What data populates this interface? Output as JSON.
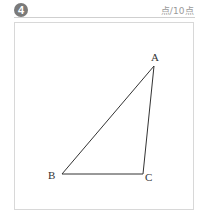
{
  "question": {
    "number": "4",
    "score_label": "点/10点"
  },
  "figure": {
    "type": "triangle",
    "vertices": [
      {
        "name": "A",
        "x": 154,
        "y": 66
      },
      {
        "name": "B",
        "x": 62,
        "y": 174
      },
      {
        "name": "C",
        "x": 143,
        "y": 174
      }
    ],
    "labels": {
      "A": "A",
      "B": "B",
      "C": "C"
    },
    "line_color": "#333333"
  }
}
